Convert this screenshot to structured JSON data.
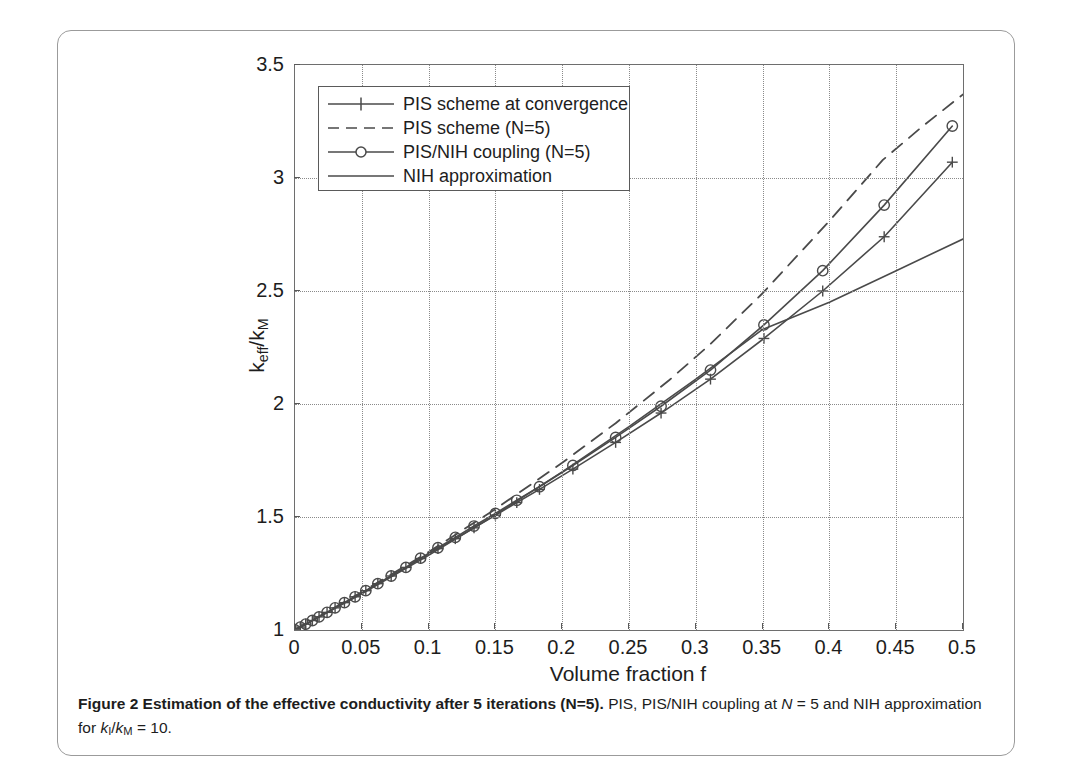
{
  "figure": {
    "caption_bold": "Figure 2 Estimation of the effective conductivity after 5 iterations (N=5).",
    "caption_rest_1": " PIS, PIS/NIH coupling at ",
    "caption_italic_n": "N",
    "caption_rest_2": " = 5 and NIH approximation for ",
    "caption_italic_k1": "k",
    "caption_sub_i": "I",
    "caption_slash": "/",
    "caption_italic_k2": "k",
    "caption_sub_m": "M",
    "caption_rest_3": " = 10."
  },
  "colors": {
    "axis": "#6e6e6e",
    "grid": "#8a8a8a",
    "curve": "#4a4a4a",
    "text": "#1d1d1d",
    "card_border": "#9b9b9b",
    "background": "#ffffff"
  },
  "legend": {
    "position": "upper-left-inside",
    "entries": [
      {
        "label": "PIS scheme at convergence",
        "style": "solid",
        "marker": "plus"
      },
      {
        "label": "PIS scheme (N=5)",
        "style": "dashed",
        "marker": "none"
      },
      {
        "label": "PIS/NIH coupling (N=5)",
        "style": "solid",
        "marker": "circle"
      },
      {
        "label": "NIH approximation",
        "style": "solid",
        "marker": "none"
      }
    ]
  },
  "chart_data": {
    "type": "line",
    "title": "",
    "xlabel": "Volume fraction f",
    "ylabel": "k_eff/k_M",
    "ylabel_base": "k",
    "ylabel_sub1": "eff",
    "ylabel_mid": "/k",
    "ylabel_sub2": "M",
    "xlim": [
      0,
      0.5
    ],
    "ylim": [
      1,
      3.5
    ],
    "xticks": [
      0,
      0.05,
      0.1,
      0.15,
      0.2,
      0.25,
      0.3,
      0.35,
      0.4,
      0.45,
      0.5
    ],
    "xticklabels": [
      "0",
      "0.05",
      "0.1",
      "0.15",
      "0.2",
      "0.25",
      "0.3",
      "0.35",
      "0.4",
      "0.45",
      "0.5"
    ],
    "yticks": [
      1,
      1.5,
      2,
      2.5,
      3,
      3.5
    ],
    "yticklabels": [
      "1",
      "1.5",
      "2",
      "2.5",
      "3",
      "3.5"
    ],
    "grid": true,
    "grid_style": "dotted",
    "legend_position": "upper left",
    "series": [
      {
        "name": "PIS scheme at convergence",
        "style": "solid",
        "marker": "plus",
        "x": [
          0.0,
          0.004,
          0.008,
          0.013,
          0.018,
          0.024,
          0.03,
          0.037,
          0.045,
          0.053,
          0.062,
          0.072,
          0.083,
          0.094,
          0.107,
          0.12,
          0.134,
          0.15,
          0.166,
          0.183,
          0.208,
          0.24,
          0.274,
          0.311,
          0.351,
          0.395,
          0.441,
          0.492
        ],
        "y": [
          1.0,
          1.013,
          1.026,
          1.042,
          1.058,
          1.078,
          1.098,
          1.121,
          1.147,
          1.174,
          1.205,
          1.239,
          1.277,
          1.316,
          1.362,
          1.409,
          1.461,
          1.521,
          1.583,
          1.649,
          1.755,
          1.9,
          2.062,
          2.252,
          2.475,
          2.742,
          3.05,
          3.4
        ],
        "y_plotted": [
          1.0,
          1.013,
          1.026,
          1.042,
          1.058,
          1.078,
          1.098,
          1.121,
          1.147,
          1.174,
          1.205,
          1.239,
          1.277,
          1.316,
          1.36,
          1.404,
          1.452,
          1.508,
          1.564,
          1.622,
          1.712,
          1.83,
          1.96,
          2.11,
          2.29,
          2.5,
          2.74,
          3.07
        ]
      },
      {
        "name": "PIS scheme (N=5)",
        "style": "dashed",
        "marker": "none",
        "x": [
          0.0,
          0.05,
          0.1,
          0.15,
          0.2,
          0.24,
          0.28,
          0.31,
          0.35,
          0.4,
          0.44,
          0.47,
          0.5
        ],
        "y": [
          1.0,
          1.168,
          1.345,
          1.535,
          1.74,
          1.915,
          2.105,
          2.26,
          2.49,
          2.81,
          3.08,
          3.23,
          3.37
        ]
      },
      {
        "name": "PIS/NIH coupling (N=5)",
        "style": "solid",
        "marker": "circle",
        "x": [
          0.0,
          0.004,
          0.008,
          0.013,
          0.018,
          0.024,
          0.03,
          0.037,
          0.045,
          0.053,
          0.062,
          0.072,
          0.083,
          0.094,
          0.107,
          0.12,
          0.134,
          0.15,
          0.166,
          0.183,
          0.208,
          0.24,
          0.274,
          0.311,
          0.351,
          0.395,
          0.441,
          0.492
        ],
        "y": [
          1.0,
          1.013,
          1.026,
          1.042,
          1.058,
          1.078,
          1.098,
          1.121,
          1.147,
          1.174,
          1.205,
          1.239,
          1.277,
          1.318,
          1.364,
          1.41,
          1.46,
          1.516,
          1.574,
          1.634,
          1.728,
          1.852,
          1.99,
          2.15,
          2.35,
          2.59,
          2.88,
          3.23
        ]
      },
      {
        "name": "NIH approximation",
        "style": "solid",
        "marker": "none",
        "x": [
          0.0,
          0.05,
          0.1,
          0.15,
          0.2,
          0.25,
          0.3,
          0.35,
          0.4,
          0.45,
          0.5
        ],
        "y": [
          1.0,
          1.16,
          1.33,
          1.51,
          1.7,
          1.9,
          2.11,
          2.33,
          2.45,
          2.59,
          2.73
        ]
      }
    ]
  }
}
